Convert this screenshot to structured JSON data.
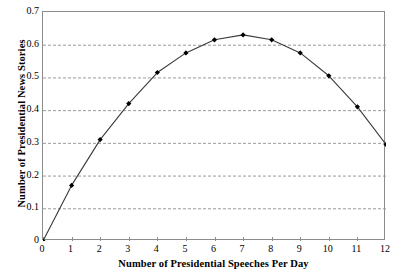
{
  "chart_data": {
    "type": "line",
    "title": "",
    "xlabel": "Number of Presidential Speeches Per Day",
    "ylabel": "Number of Presidential News Stories",
    "x": [
      0,
      1,
      2,
      3,
      4,
      5,
      6,
      7,
      8,
      9,
      10,
      11,
      12
    ],
    "values": [
      0,
      0.17,
      0.31,
      0.42,
      0.515,
      0.575,
      0.615,
      0.63,
      0.615,
      0.575,
      0.505,
      0.41,
      0.295
    ],
    "series": [
      {
        "name": "Presidential News Stories",
        "values": [
          0,
          0.17,
          0.31,
          0.42,
          0.515,
          0.575,
          0.615,
          0.63,
          0.615,
          0.575,
          0.505,
          0.41,
          0.295
        ]
      }
    ],
    "xlim": [
      0,
      12
    ],
    "ylim": [
      0,
      0.7
    ],
    "x_tick_labels": [
      "0",
      "1",
      "2",
      "3",
      "4",
      "5",
      "6",
      "7",
      "8",
      "9",
      "10",
      "11",
      "12"
    ],
    "y_tick_labels": [
      "0",
      "0.1",
      "0.2",
      "0.3",
      "0.4",
      "0.5",
      "0.6",
      "0.7"
    ],
    "y_tick_values": [
      0,
      0.1,
      0.2,
      0.3,
      0.4,
      0.5,
      0.6,
      0.7
    ],
    "grid": "horizontal-dashed",
    "legend": "none",
    "marker": "filled-diamond",
    "line_color": "#3a3a3a",
    "marker_color": "#000000",
    "grid_color": "#9a9a9a",
    "axis_color": "#8c8c8c",
    "background_color": "#ffffff"
  }
}
